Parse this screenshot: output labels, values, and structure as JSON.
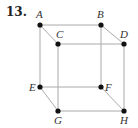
{
  "problem": {
    "number": "13."
  },
  "cube": {
    "edge_color": "#aaaaaa",
    "vertex_color": "#111111",
    "vertices": [
      {
        "label": "A",
        "x": 40,
        "y": 25,
        "lx": 36,
        "ly": 18
      },
      {
        "label": "B",
        "x": 101,
        "y": 25,
        "lx": 97,
        "ly": 18
      },
      {
        "label": "C",
        "x": 58,
        "y": 44,
        "lx": 56,
        "ly": 38
      },
      {
        "label": "D",
        "x": 124,
        "y": 44,
        "lx": 120,
        "ly": 38
      },
      {
        "label": "E",
        "x": 40,
        "y": 87,
        "lx": 29,
        "ly": 91
      },
      {
        "label": "F",
        "x": 101,
        "y": 87,
        "lx": 105,
        "ly": 91
      },
      {
        "label": "G",
        "x": 58,
        "y": 111,
        "lx": 54,
        "ly": 124
      },
      {
        "label": "H",
        "x": 124,
        "y": 111,
        "lx": 120,
        "ly": 124
      }
    ],
    "edges": [
      [
        "A",
        "B"
      ],
      [
        "C",
        "D"
      ],
      [
        "E",
        "F"
      ],
      [
        "G",
        "H"
      ],
      [
        "A",
        "C"
      ],
      [
        "B",
        "D"
      ],
      [
        "E",
        "G"
      ],
      [
        "F",
        "H"
      ],
      [
        "A",
        "E"
      ],
      [
        "B",
        "F"
      ],
      [
        "C",
        "G"
      ],
      [
        "D",
        "H"
      ]
    ]
  }
}
